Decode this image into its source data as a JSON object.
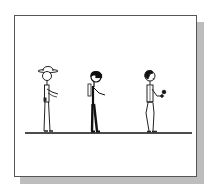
{
  "panel": {
    "description": "Comic panel with three stick figures standing on a ground line",
    "colors": {
      "border": "#555555",
      "shadow": "#bdbdbd",
      "background": "#ffffff",
      "ink": "#111111"
    },
    "figures": [
      {
        "name": "figure-with-hat",
        "description": "Stick figure wearing a wide-brim hat, arm extended forward"
      },
      {
        "name": "figure-with-goggles",
        "description": "Stick figure with dark hair/goggles and dark pants, arm reaching forward"
      },
      {
        "name": "figure-with-object",
        "description": "Stick figure with curly hair holding a small dark object"
      }
    ]
  }
}
